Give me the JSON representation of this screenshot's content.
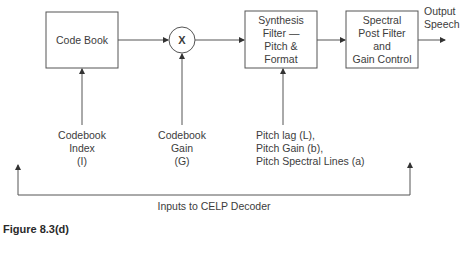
{
  "diagram": {
    "blocks": {
      "code_book": {
        "label": "Code Book"
      },
      "multiplier": {
        "label": "X"
      },
      "synthesis_filter": {
        "lines": [
          "Synthesis",
          "Filter —",
          "Pitch &",
          "Format"
        ]
      },
      "post_filter": {
        "lines": [
          "Spectral",
          "Post Filter",
          "and",
          "Gain Control"
        ]
      }
    },
    "output": {
      "lines": [
        "Output",
        "Speech"
      ]
    },
    "inputs": {
      "codebook_index": {
        "lines": [
          "Codebook",
          "Index",
          "(I)"
        ]
      },
      "codebook_gain": {
        "lines": [
          "Codebook",
          "Gain",
          "(G)"
        ]
      },
      "pitch_params": {
        "lines": [
          "Pitch lag (L),",
          "Pitch Gain (b),",
          "Pitch Spectral Lines (a)"
        ]
      }
    },
    "bracket_label": "Inputs to CELP Decoder",
    "caption": "Figure 8.3(d)",
    "colors": {
      "stroke": "#555555",
      "text": "#3c3c3c"
    }
  }
}
